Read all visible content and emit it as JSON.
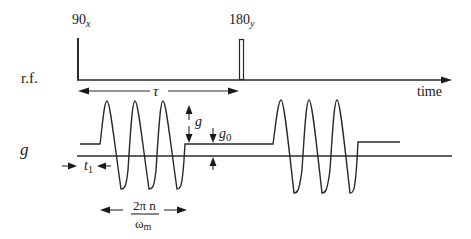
{
  "diagram": {
    "rows": {
      "rf_label": "r.f.",
      "g_label": "g"
    },
    "pulses": [
      {
        "label_main": "90",
        "label_sub": "x",
        "type": "narrow"
      },
      {
        "label_main": "180",
        "label_sub": "y",
        "type": "wide"
      }
    ],
    "axis": {
      "time_label": "time"
    },
    "annotations": {
      "tau": "τ",
      "g_amplitude": "g",
      "g0_main": "g",
      "g0_sub": "0",
      "t1_main": "t",
      "t1_sub": "1",
      "period_numerator": "2π n",
      "period_denominator_main": "ω",
      "period_denominator_sub": "m"
    },
    "gradient": {
      "cycles_per_burst": 3,
      "bursts": 2,
      "baseline_offset": "g0"
    }
  }
}
